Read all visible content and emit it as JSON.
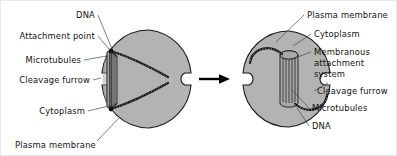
{
  "figure": {
    "background_color": "#ffffff",
    "cell_fill_color": "#b3b3b3",
    "outline_color": "#1a1a1a",
    "text_color": "#121212"
  },
  "left_cell": {
    "name": "early-division-cell",
    "labels": [
      {
        "id": "dna",
        "text": "DNA"
      },
      {
        "id": "attachment-point",
        "text": "Attachment point"
      },
      {
        "id": "microtubules",
        "text": "Microtubules"
      },
      {
        "id": "cleavage-furrow",
        "text": "Cleavage furrow"
      },
      {
        "id": "cytoplasm",
        "text": "Cytoplasm"
      },
      {
        "id": "plasma-membrane",
        "text": "Plasma membrane"
      }
    ]
  },
  "right_cell": {
    "name": "late-division-cell",
    "labels": [
      {
        "id": "plasma-membrane",
        "text": "Plasma membrane"
      },
      {
        "id": "cytoplasm",
        "text": "Cytoplasm"
      },
      {
        "id": "membranous-attachment-system-line1",
        "text": "Membranous"
      },
      {
        "id": "membranous-attachment-system-line2",
        "text": "attachment"
      },
      {
        "id": "membranous-attachment-system-line3",
        "text": "system"
      },
      {
        "id": "cleavage-furrow",
        "text": "Cleavage furrow"
      },
      {
        "id": "microtubules",
        "text": "Microtubules"
      },
      {
        "id": "dna",
        "text": "DNA"
      }
    ]
  },
  "arrow": {
    "name": "progression-arrow",
    "direction": "right"
  }
}
